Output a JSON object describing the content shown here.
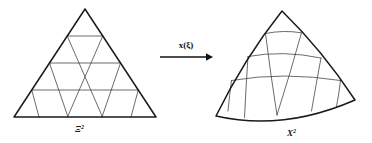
{
  "figure": {
    "background_color": "#ffffff",
    "line_color": "#1a1a1a",
    "mesh_color": "#3a3a3a",
    "width": 372,
    "height": 143
  },
  "reference_domain": {
    "label_base": "Ξ",
    "label_exponent": "2",
    "label_full": "Ξ²",
    "description": "reference triangle",
    "subdivisions": 4,
    "triangle_count": 16,
    "apex": [
      85,
      9
    ],
    "bottom_left": [
      14,
      117
    ],
    "bottom_right": [
      156,
      117
    ]
  },
  "mapping": {
    "label": "x(ξ)",
    "arrow_direction": "right",
    "arrow_start_x": 160,
    "arrow_end_x": 212,
    "arrow_y": 57
  },
  "physical_domain": {
    "label_base": "X",
    "label_exponent": "2",
    "label_full": "X²",
    "description": "curved physical element",
    "subdivisions": 4,
    "triangle_count": 16,
    "apex": [
      282,
      11
    ],
    "bottom_left": [
      216,
      116
    ],
    "bottom_right": [
      355,
      100
    ]
  }
}
